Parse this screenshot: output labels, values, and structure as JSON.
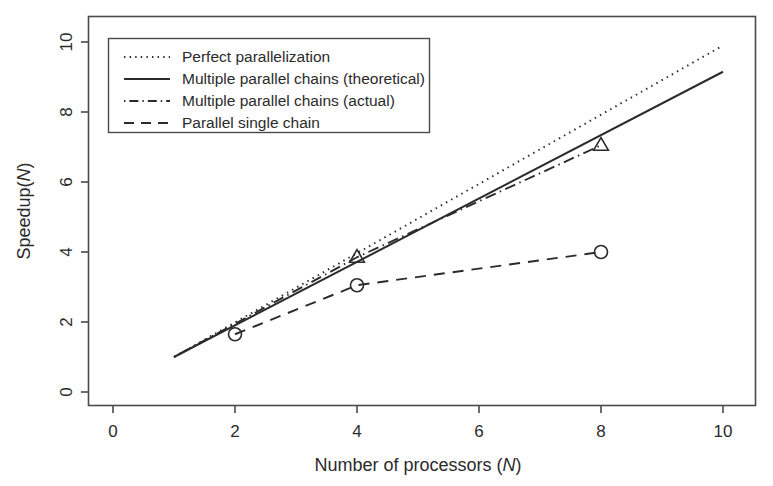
{
  "chart_data": {
    "type": "line",
    "title": "",
    "xlabel": "Number of processors (N)",
    "xlabel_plain": "Number of processors",
    "xlabel_italic": "N",
    "ylabel": "Speedup(N)",
    "ylabel_plain": "Speedup",
    "ylabel_italic": "N",
    "xlim": [
      0,
      10
    ],
    "ylim": [
      0,
      10
    ],
    "xticks": [
      0,
      2,
      4,
      6,
      8,
      10
    ],
    "yticks": [
      0,
      2,
      4,
      6,
      8,
      10
    ],
    "xtick_labels": [
      "0",
      "2",
      "4",
      "6",
      "8",
      "10"
    ],
    "ytick_labels": [
      "0",
      "2",
      "4",
      "6",
      "8",
      "10"
    ],
    "grid": false,
    "legend_position": "top-left",
    "series": [
      {
        "name": "Perfect parallelization",
        "style": "dotted",
        "marker": "none",
        "x": [
          1,
          10
        ],
        "y": [
          1,
          9.9
        ]
      },
      {
        "name": "Multiple parallel chains (theoretical)",
        "style": "solid",
        "marker": "none",
        "x": [
          1,
          10
        ],
        "y": [
          1,
          9.15
        ]
      },
      {
        "name": "Multiple parallel chains (actual)",
        "style": "dashdot",
        "marker": "triangle",
        "x": [
          1,
          4,
          8
        ],
        "y": [
          1,
          3.85,
          7.05
        ]
      },
      {
        "name": "Parallel single chain",
        "style": "dashed",
        "marker": "circle",
        "x": [
          2,
          4,
          8
        ],
        "y": [
          1.65,
          3.05,
          4.0
        ]
      }
    ],
    "data_points": [
      {
        "series": "Multiple parallel chains (actual)",
        "x": 4,
        "y": 3.85,
        "marker": "triangle"
      },
      {
        "series": "Multiple parallel chains (actual)",
        "x": 8,
        "y": 7.05,
        "marker": "triangle"
      },
      {
        "series": "Parallel single chain",
        "x": 2,
        "y": 1.65,
        "marker": "circle"
      },
      {
        "series": "Parallel single chain",
        "x": 4,
        "y": 3.05,
        "marker": "circle"
      },
      {
        "series": "Parallel single chain",
        "x": 8,
        "y": 4.0,
        "marker": "circle"
      }
    ]
  },
  "legend": {
    "entries": [
      "Perfect parallelization",
      "Multiple parallel chains (theoretical)",
      "Multiple parallel chains (actual)",
      "Parallel single chain"
    ]
  },
  "colors": {
    "axis": "#4a4a4a",
    "text": "#2b2b2b",
    "series": "#2b2b2b",
    "background": "#ffffff"
  }
}
